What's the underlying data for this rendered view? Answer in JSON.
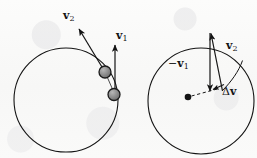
{
  "figure": {
    "type": "physics-vector-diagram",
    "background_color": "#fbfbfa",
    "ink_color": "#141414",
    "ball_fill_color": "#8c8c8c",
    "ball_edge_color": "#1a1a1a"
  },
  "panels": [
    {
      "id": "left",
      "name": "circular-path-panel",
      "circle": {
        "cx": 66,
        "cy": 100,
        "r": 52
      },
      "balls": [
        {
          "name": "ball-upper",
          "cx": 105,
          "cy": 72,
          "r": 6
        },
        {
          "name": "ball-lower",
          "cx": 114,
          "cy": 94,
          "r": 6
        }
      ],
      "chord": {
        "x1": 105,
        "y1": 72,
        "x2": 115,
        "y2": 96
      },
      "vectors": [
        {
          "name": "v2",
          "label": "v",
          "subscript": "2",
          "sign": "",
          "x1": 105,
          "y1": 72,
          "x2": 78,
          "y2": 27
        },
        {
          "name": "v1",
          "label": "v",
          "subscript": "1",
          "sign": "",
          "x1": 115,
          "y1": 95,
          "x2": 115,
          "y2": 44
        }
      ]
    },
    {
      "id": "right",
      "name": "vector-subtraction-panel",
      "circle": {
        "cx": 201,
        "cy": 101,
        "r": 53
      },
      "center_dot": {
        "name": "center-dot",
        "cx": 188,
        "cy": 97,
        "r": 3.2
      },
      "dashed_line": {
        "x1": 191,
        "y1": 96,
        "x2": 220,
        "y2": 88
      },
      "arc": {
        "from_x": 222,
        "from_y": 90,
        "to_x": 241,
        "to_y": 61
      },
      "vectors": [
        {
          "name": "minus-v1",
          "label": "v",
          "subscript": "1",
          "sign": "−",
          "x1": 210,
          "y1": 33,
          "x2": 210,
          "y2": 92
        },
        {
          "name": "v2",
          "label": "v",
          "subscript": "2",
          "sign": "",
          "x1": 222,
          "y1": 91,
          "x2": 211,
          "y2": 32
        },
        {
          "name": "delta-v",
          "label": "v",
          "subscript": "",
          "sign": "Δ",
          "x1": 224,
          "y1": 84,
          "x2": 212,
          "y2": 90
        }
      ]
    }
  ],
  "labels": {
    "v2_left": {
      "sign": "",
      "symbol": "v",
      "sub": "2"
    },
    "v1_left": {
      "sign": "",
      "symbol": "v",
      "sub": "1"
    },
    "v1_neg_right": {
      "sign": "−",
      "symbol": "v",
      "sub": "1"
    },
    "v2_right": {
      "sign": "",
      "symbol": "v",
      "sub": "2"
    },
    "delta_v": {
      "sign": "Δ",
      "symbol": "v",
      "sub": ""
    }
  }
}
